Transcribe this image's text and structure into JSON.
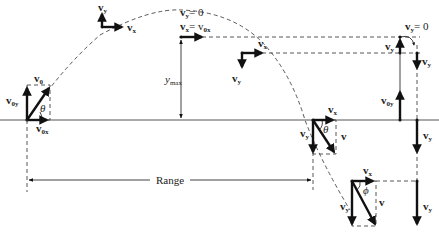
{
  "diagram": {
    "labels": {
      "v0": "v",
      "v0_sub": "0",
      "v0y": "v",
      "v0y_sub": "0y",
      "v0x": "v",
      "v0x_sub": "0x",
      "theta": "θ",
      "phi": "ϕ",
      "vx": "v",
      "vx_sub": "x",
      "vy": "v",
      "vy_sub": "y",
      "v": "v",
      "apex_vy_eq": "= 0",
      "apex_vx_eq": "= v",
      "apex_vx_eq_sub": "0x",
      "ymax": "y",
      "ymax_sub": "max",
      "range": "Range",
      "right_vy_zero": "= 0"
    },
    "colors": {
      "ink": "#111111",
      "dashed": "#444444",
      "background": "#ffffff"
    }
  }
}
